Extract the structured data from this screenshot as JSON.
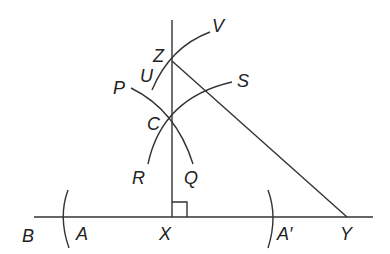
{
  "diagram": {
    "labels": {
      "B": "B",
      "A": "A",
      "X": "X",
      "A_prime": "A′",
      "Y": "Y",
      "Z": "Z",
      "V": "V",
      "U": "U",
      "P": "P",
      "S": "S",
      "C": "C",
      "R": "R",
      "Q": "Q"
    },
    "colors": {
      "stroke": "#333333",
      "text": "#222222",
      "background": "#ffffff"
    }
  }
}
